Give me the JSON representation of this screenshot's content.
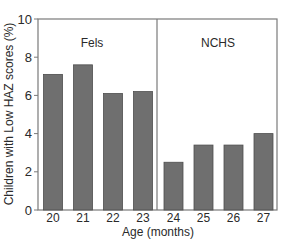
{
  "chart_data": {
    "type": "bar",
    "title": "",
    "xlabel": "Age (months)",
    "ylabel": "Children with Low HAZ scores (%)",
    "ylim": [
      0,
      10
    ],
    "yticks": [
      0,
      2,
      4,
      6,
      8,
      10
    ],
    "grid": false,
    "legend": null,
    "categories": [
      "20",
      "21",
      "22",
      "23",
      "24",
      "25",
      "26",
      "27"
    ],
    "values": [
      7.1,
      7.6,
      6.1,
      6.2,
      2.5,
      3.4,
      3.4,
      4.0
    ],
    "panels": [
      {
        "label": "Fels",
        "categories": [
          "20",
          "21",
          "22",
          "23"
        ],
        "values": [
          7.1,
          7.6,
          6.1,
          6.2
        ]
      },
      {
        "label": "NCHS",
        "categories": [
          "24",
          "25",
          "26",
          "27"
        ],
        "values": [
          2.5,
          3.4,
          3.4,
          4.0
        ]
      }
    ],
    "annotations": [
      "Fels",
      "NCHS"
    ],
    "colors": {
      "bar_fill": "#6f6f6f",
      "bar_stroke": "#4e4e4e",
      "axis": "#7a7a7a"
    }
  }
}
